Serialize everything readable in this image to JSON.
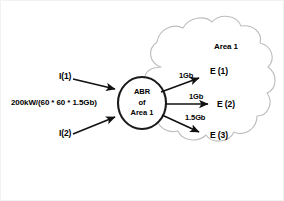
{
  "diagram": {
    "cloud": {
      "label": "Area 1",
      "stroke_color": "#bdbdbd"
    },
    "router": {
      "line1": "ABR",
      "line2": "of",
      "line3": "Area 1",
      "stroke_color": "#1a1a1a",
      "fill_color": "#ffffff"
    },
    "formula": {
      "label": "200kW/(60 * 60 * 1.5Gb)"
    },
    "inputs": [
      {
        "label": "I(1)"
      },
      {
        "label": "I(2)"
      }
    ],
    "outputs": [
      {
        "rate": "1Gb",
        "label": "E (1)"
      },
      {
        "rate": "1Gb",
        "label": "E (2)"
      },
      {
        "rate": "1.5Gb",
        "label": "E (3)"
      }
    ],
    "colors": {
      "ink": "#000000",
      "background": "#ffffff",
      "cloud_outline": "#bdbdbd",
      "arrow": "#111111"
    }
  }
}
